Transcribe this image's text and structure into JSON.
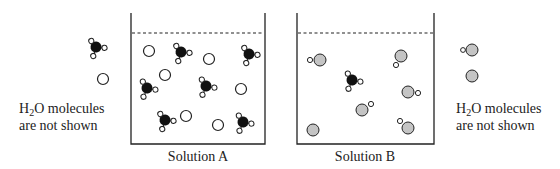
{
  "legend_left": {
    "line1_prefix": "H",
    "line1_sub": "2",
    "line1_suffix": "O molecules",
    "line2": "are not shown"
  },
  "legend_right": {
    "line1_prefix": "H",
    "line1_sub": "2",
    "line1_suffix": "O molecules",
    "line2": "are not shown"
  },
  "beakers": [
    {
      "caption": "Solution A"
    },
    {
      "caption": "Solution B"
    }
  ],
  "colors": {
    "black_particle": "#111111",
    "gray_particle": "#c4c4c4",
    "outline": "#222222"
  }
}
